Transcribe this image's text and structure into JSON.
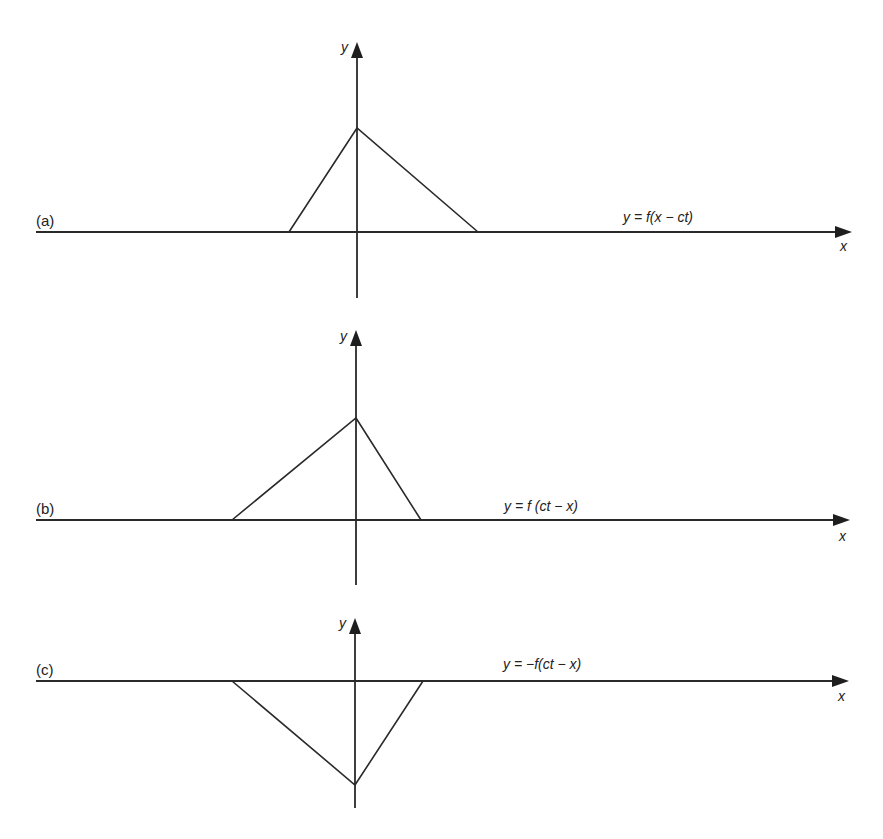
{
  "figure": {
    "background": "#ffffff",
    "ink": "#222222",
    "axis_labels": {
      "x": "x",
      "y": "y"
    },
    "panels": [
      {
        "id": "a",
        "label": "(a)",
        "equation": "y = f(x − ct)",
        "shape": "triangle-up",
        "origin": [
          357,
          232
        ],
        "yaxis": {
          "top": 42,
          "bottom": 298
        },
        "xaxis": {
          "left": 36,
          "right": 852
        },
        "points": [
          [
            289,
            232
          ],
          [
            357,
            128
          ],
          [
            478,
            232
          ]
        ],
        "equation_pos": [
          623,
          222
        ],
        "panel_label_pos": [
          36,
          226
        ],
        "xlabel_pos": [
          840,
          251
        ],
        "ylabel_pos": [
          341,
          52
        ]
      },
      {
        "id": "b",
        "label": "(b)",
        "equation": "y = f (ct − x)",
        "shape": "triangle-up-mirrored",
        "origin": [
          356,
          520
        ],
        "yaxis": {
          "top": 330,
          "bottom": 585
        },
        "xaxis": {
          "left": 36,
          "right": 850
        },
        "points": [
          [
            232,
            520
          ],
          [
            356,
            418
          ],
          [
            421,
            520
          ]
        ],
        "equation_pos": [
          504,
          511
        ],
        "panel_label_pos": [
          36,
          514
        ],
        "xlabel_pos": [
          839,
          541
        ],
        "ylabel_pos": [
          340,
          341
        ]
      },
      {
        "id": "c",
        "label": "(c)",
        "equation": "y = −f(ct − x)",
        "shape": "triangle-down",
        "origin": [
          355,
          681
        ],
        "yaxis": {
          "top": 618,
          "bottom": 808
        },
        "xaxis": {
          "left": 36,
          "right": 849
        },
        "points": [
          [
            232,
            681
          ],
          [
            355,
            785
          ],
          [
            423,
            681
          ]
        ],
        "equation_pos": [
          503,
          669
        ],
        "panel_label_pos": [
          36,
          675
        ],
        "xlabel_pos": [
          838,
          701
        ],
        "ylabel_pos": [
          339,
          628
        ]
      }
    ]
  }
}
